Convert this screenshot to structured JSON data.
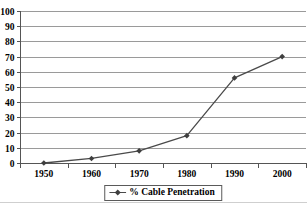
{
  "chart_data": {
    "type": "line",
    "categories": [
      "1950",
      "1960",
      "1970",
      "1980",
      "1990",
      "2000"
    ],
    "series": [
      {
        "name": "% Cable Penetration",
        "values": [
          0,
          3,
          8,
          18,
          56,
          70
        ],
        "marker": "diamond"
      }
    ],
    "title": "",
    "xlabel": "",
    "ylabel": "",
    "ylim": [
      0,
      100
    ],
    "ytick_interval": 10,
    "ytick_labels": [
      "0",
      "10",
      "20",
      "30",
      "40",
      "50",
      "60",
      "70",
      "80",
      "90",
      "100"
    ],
    "grid": true,
    "legend_position": "bottom-center",
    "legend_label": "% Cable Penetration",
    "colors": {
      "line": "#4a4a4a",
      "marker": "#3f3f3f",
      "grid": "#9a9a9a",
      "axis": "#555555",
      "text": "#000000",
      "legend_border": "#5a5a5a",
      "background": "#ffffff"
    }
  }
}
